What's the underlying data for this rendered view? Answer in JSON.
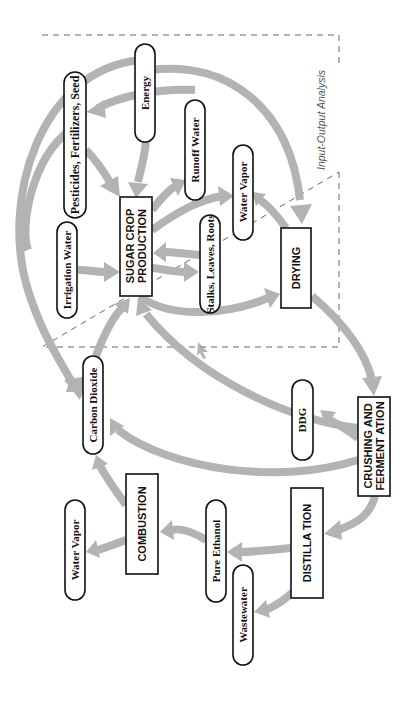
{
  "diagram": {
    "region_label": "Input-Output Analysis",
    "colors": {
      "arrow": "#b3b3b3",
      "outline": "#111111",
      "region_border": "#666666",
      "background": "#ffffff"
    },
    "nodes": {
      "energy": {
        "label": "Energy",
        "shape": "pill"
      },
      "pesticides": {
        "label": "Pesticides, Fertilizers, Seed",
        "shape": "pill"
      },
      "irrigation": {
        "label": "Irrigation Water",
        "shape": "pill"
      },
      "sugar_crop": {
        "label_line1": "SUGAR CROP",
        "label_line2": "PRODUCTION",
        "shape": "box"
      },
      "runoff": {
        "label": "Runoff  Water",
        "shape": "pill"
      },
      "water_vapor_top": {
        "label": "Water Vapor",
        "shape": "pill"
      },
      "stalks": {
        "label": "Stalks, Leaves, Roots",
        "shape": "pill"
      },
      "drying": {
        "label": "DRYING",
        "shape": "box"
      },
      "carbon_dioxide": {
        "label": "Carbon Dioxide",
        "shape": "pill"
      },
      "ddg": {
        "label": "DDG",
        "shape": "pill"
      },
      "crushing": {
        "label_line1": "CRUSHING AND",
        "label_line2": "FERMENT ATION",
        "shape": "box"
      },
      "combustion": {
        "label": "COMBUSTION",
        "shape": "box"
      },
      "distillation": {
        "label": "DISTILLA TION",
        "shape": "box"
      },
      "water_vapor_bottom": {
        "label": "Water Vapor",
        "shape": "pill"
      },
      "pure_ethanol": {
        "label": "Pure Ethanol",
        "shape": "pill"
      },
      "wastewater": {
        "label": "Wastewater",
        "shape": "pill"
      }
    },
    "edges": [
      {
        "from": "energy",
        "to": "sugar_crop"
      },
      {
        "from": "energy",
        "to": "pesticides"
      },
      {
        "from": "energy",
        "to": "drying"
      },
      {
        "from": "energy",
        "to": "carbon_dioxide"
      },
      {
        "from": "pesticides",
        "to": "sugar_crop"
      },
      {
        "from": "pesticides",
        "to": "carbon_dioxide"
      },
      {
        "from": "irrigation",
        "to": "sugar_crop"
      },
      {
        "from": "sugar_crop",
        "to": "runoff"
      },
      {
        "from": "sugar_crop",
        "to": "water_vapor_top"
      },
      {
        "from": "sugar_crop",
        "to": "stalks"
      },
      {
        "from": "stalks",
        "to": "sugar_crop"
      },
      {
        "from": "sugar_crop",
        "to": "drying"
      },
      {
        "from": "drying",
        "to": "water_vapor_top"
      },
      {
        "from": "drying",
        "to": "crushing"
      },
      {
        "from": "carbon_dioxide",
        "to": "sugar_crop"
      },
      {
        "from": "crushing",
        "to": "sugar_crop"
      },
      {
        "from": "crushing",
        "to": "ddg"
      },
      {
        "from": "crushing",
        "to": "carbon_dioxide"
      },
      {
        "from": "crushing",
        "to": "distillation"
      },
      {
        "from": "distillation",
        "to": "pure_ethanol"
      },
      {
        "from": "distillation",
        "to": "wastewater"
      },
      {
        "from": "pure_ethanol",
        "to": "combustion"
      },
      {
        "from": "combustion",
        "to": "carbon_dioxide"
      },
      {
        "from": "combustion",
        "to": "water_vapor_bottom"
      }
    ]
  }
}
